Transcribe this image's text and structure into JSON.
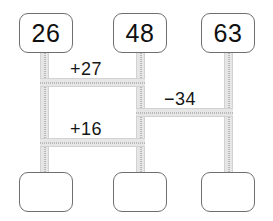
{
  "diagram": {
    "type": "arithmetic-ladder",
    "canvas": {
      "width": 273,
      "height": 221,
      "background": "#ffffff"
    },
    "colors": {
      "box_border": "#6f6f6f",
      "box_fill": "#ffffff",
      "connector_fill": "#e6e6e6",
      "connector_edge": "#d2d2d2",
      "connector_dotted": "#8e8e8e",
      "text": "#101010"
    },
    "columns": [
      {
        "id": "left",
        "top_value": "26",
        "bottom_value": ""
      },
      {
        "id": "middle",
        "top_value": "48",
        "bottom_value": ""
      },
      {
        "id": "right",
        "top_value": "63",
        "bottom_value": ""
      }
    ],
    "top_nodes": [
      {
        "name": "top-node-left",
        "value": "26"
      },
      {
        "name": "top-node-middle",
        "value": "48"
      },
      {
        "name": "top-node-right",
        "value": "63"
      }
    ],
    "bottom_nodes": [
      {
        "name": "bottom-node-left",
        "value": ""
      },
      {
        "name": "bottom-node-middle",
        "value": ""
      },
      {
        "name": "bottom-node-right",
        "value": ""
      }
    ],
    "operations": [
      {
        "name": "operation-plus-27",
        "label": "+27",
        "sign": "+",
        "magnitude": 27,
        "from": "left",
        "to": "middle"
      },
      {
        "name": "operation-minus-34",
        "label": "−34",
        "sign": "−",
        "magnitude": 34,
        "from": "middle",
        "to": "right"
      },
      {
        "name": "operation-plus-16",
        "label": "+16",
        "sign": "+",
        "magnitude": 16,
        "from": "left",
        "to": "middle"
      }
    ]
  }
}
